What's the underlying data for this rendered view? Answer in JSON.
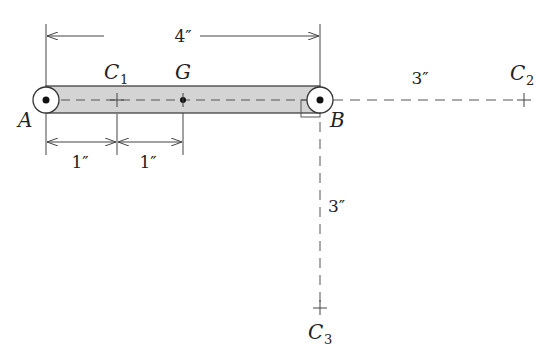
{
  "diagram": {
    "points": {
      "A": {
        "label": "A"
      },
      "B": {
        "label": "B"
      },
      "G": {
        "label": "G"
      },
      "C1": {
        "label": "C",
        "sub": "1"
      },
      "C2": {
        "label": "C",
        "sub": "2"
      },
      "C3": {
        "label": "C",
        "sub": "3"
      }
    },
    "dimensions": {
      "AB": "4″",
      "A_C1": "1″",
      "C1_G": "1″",
      "B_C2": "3″",
      "B_C3": "3″"
    },
    "colors": {
      "bar_fill": "#d4d4d4",
      "line": "#333333"
    }
  }
}
